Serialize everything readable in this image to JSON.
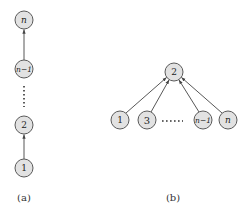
{
  "diagram_a": {
    "caption": "(a)",
    "nodes": [
      {
        "id": "n",
        "label": "n",
        "italic": true,
        "x": 24,
        "y": 20
      },
      {
        "id": "n_minus_1",
        "label": "n−1",
        "italic": true,
        "x": 24,
        "y": 69
      },
      {
        "id": "2",
        "label": "2",
        "italic": false,
        "x": 24,
        "y": 125
      },
      {
        "id": "1",
        "label": "1",
        "italic": false,
        "x": 24,
        "y": 168
      }
    ],
    "edges": [
      {
        "from": "1",
        "to": "2"
      },
      {
        "from": "n_minus_1",
        "to": "n"
      }
    ],
    "ellipsis": {
      "orientation": "vertical",
      "between": [
        "n_minus_1",
        "2"
      ]
    }
  },
  "diagram_b": {
    "caption": "(b)",
    "nodes": [
      {
        "id": "2",
        "label": "2",
        "italic": false,
        "x": 174,
        "y": 72
      },
      {
        "id": "1",
        "label": "1",
        "italic": false,
        "x": 120,
        "y": 120
      },
      {
        "id": "3",
        "label": "3",
        "italic": false,
        "x": 147,
        "y": 120
      },
      {
        "id": "n_minus_1",
        "label": "n−1",
        "italic": true,
        "x": 203,
        "y": 120
      },
      {
        "id": "n",
        "label": "n",
        "italic": true,
        "x": 228,
        "y": 120
      }
    ],
    "edges": [
      {
        "from": "1",
        "to": "2"
      },
      {
        "from": "3",
        "to": "2"
      },
      {
        "from": "n_minus_1",
        "to": "2"
      },
      {
        "from": "n",
        "to": "2"
      }
    ],
    "ellipsis": {
      "orientation": "horizontal",
      "between": [
        "3",
        "n_minus_1"
      ]
    }
  },
  "colors": {
    "node_fill": "#e2e2e2",
    "node_stroke": "#5a5a5a",
    "edge": "#444444"
  }
}
